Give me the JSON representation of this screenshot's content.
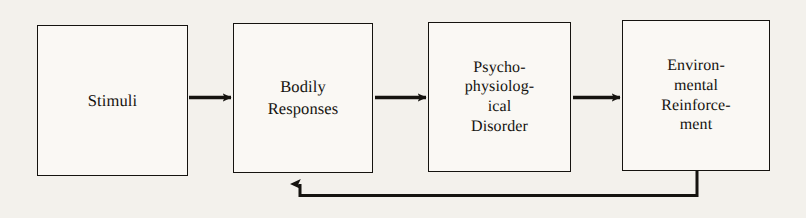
{
  "diagram": {
    "background_color": "#f3f1ec",
    "ink_color": "#15130f",
    "box_fill_color": "#faf8f4",
    "nodes": [
      {
        "id": "stimuli",
        "label": "Stimuli",
        "order": 1
      },
      {
        "id": "bodily-responses",
        "label": "Bodily\nResponses",
        "order": 2
      },
      {
        "id": "psychophysiological-disorder",
        "label": "Psycho-\nphysiolog-\nical\nDisorder",
        "order": 3
      },
      {
        "id": "environmental-reinforcement",
        "label": "Environ-\nmental\nReinforce-\nment",
        "order": 4
      }
    ],
    "edges": [
      {
        "id": "edge-stimuli-to-bodily",
        "from": "stimuli",
        "to": "bodily-responses",
        "kind": "arrow-right"
      },
      {
        "id": "edge-bodily-to-disorder",
        "from": "bodily-responses",
        "to": "psychophysiological-disorder",
        "kind": "arrow-right"
      },
      {
        "id": "edge-disorder-to-reinforcement",
        "from": "psychophysiological-disorder",
        "to": "environmental-reinforcement",
        "kind": "arrow-right"
      },
      {
        "id": "edge-reinforcement-feedback-to-bodily",
        "from": "environmental-reinforcement",
        "to": "bodily-responses",
        "kind": "feedback-loop-arrow-up"
      }
    ]
  }
}
